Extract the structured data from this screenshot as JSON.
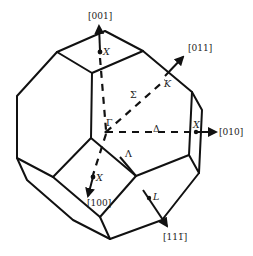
{
  "figure": {
    "directions": {
      "d001": "[001]",
      "d011": "[011]",
      "d010": "[010]",
      "d100": "[100]",
      "d111bar": "[111̅]"
    },
    "points": {
      "gamma": "Γ",
      "x_top": "X",
      "x_right": "X",
      "x_front": "X",
      "k": "K",
      "l": "L"
    },
    "lines": {
      "sigma": "Σ",
      "delta": "Δ",
      "lambda": "Λ"
    },
    "colors": {
      "stroke": "#111111",
      "background": "#ffffff"
    }
  }
}
